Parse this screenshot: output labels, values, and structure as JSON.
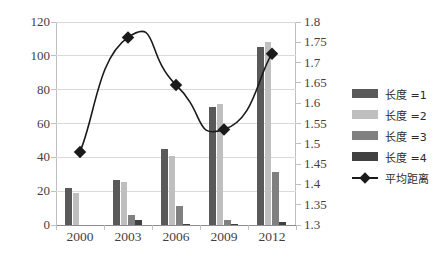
{
  "chart_data": {
    "type": "bar",
    "title": "",
    "subtitle": "",
    "xlabel": "",
    "ylabel": "",
    "categories": [
      "2000",
      "2003",
      "2006",
      "2009",
      "2012"
    ],
    "series": [
      {
        "name": "长度 =1",
        "axis": "left",
        "type": "bar",
        "color": "#595959",
        "values": [
          22,
          26.5,
          45,
          70,
          105.5
        ]
      },
      {
        "name": "长度 =2",
        "axis": "left",
        "type": "bar",
        "color": "#bfbfbf",
        "values": [
          19,
          25.5,
          41,
          71.5,
          108
        ]
      },
      {
        "name": "长度 =3",
        "axis": "left",
        "type": "bar",
        "color": "#808080",
        "values": [
          0,
          6,
          11,
          3,
          31.5
        ]
      },
      {
        "name": "长度 =4",
        "axis": "left",
        "type": "bar",
        "color": "#404040",
        "values": [
          0,
          3,
          0.5,
          0.4,
          2
        ]
      },
      {
        "name": "平均距离",
        "axis": "right",
        "type": "line",
        "color": "#1a1a1a",
        "marker": "diamond",
        "smooth": true,
        "values": [
          1.48,
          1.762,
          1.645,
          1.535,
          1.722
        ]
      }
    ],
    "left_axis": {
      "min": 0,
      "max": 120,
      "step": 20,
      "ticks": [
        "0",
        "20",
        "40",
        "60",
        "80",
        "100",
        "120"
      ]
    },
    "right_axis": {
      "min": 1.3,
      "max": 1.8,
      "step": 0.05,
      "ticks": [
        "1.3",
        "1.35",
        "1.4",
        "1.45",
        "1.5",
        "1.55",
        "1.6",
        "1.65",
        "1.7",
        "1.75",
        "1.8"
      ]
    },
    "grid": true,
    "legend_position": "right"
  },
  "legend": {
    "items": [
      {
        "label": "长度 =1",
        "marker": "bar-swatch-dark",
        "color": "#595959"
      },
      {
        "label": "长度 =2",
        "marker": "bar-swatch-light",
        "color": "#bfbfbf"
      },
      {
        "label": "长度 =3",
        "marker": "bar-swatch-medium",
        "color": "#808080"
      },
      {
        "label": "长度 =4",
        "marker": "bar-swatch-darkest",
        "color": "#404040"
      },
      {
        "label": "平均距离",
        "marker": "line-diamond-marker",
        "color": "#1a1a1a"
      }
    ]
  }
}
